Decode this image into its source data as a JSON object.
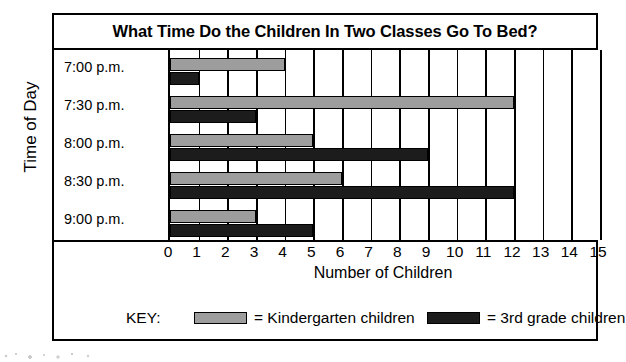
{
  "chart_data": {
    "type": "bar",
    "orientation": "horizontal",
    "title": "What Time Do the Children In Two Classes Go To Bed?",
    "xlabel": "Number of Children",
    "ylabel": "Time of Day",
    "categories": [
      "7:00 p.m.",
      "7:30 p.m.",
      "8:00 p.m.",
      "8:30 p.m.",
      "9:00 p.m."
    ],
    "series": [
      {
        "name": "= Kindergarten children",
        "short_name": "Kindergarten children",
        "color": "#9d9d9d",
        "values": [
          4,
          12,
          5,
          6,
          3
        ]
      },
      {
        "name": "= 3rd grade children",
        "short_name": "3rd grade children",
        "color": "#1c1c1c",
        "values": [
          1,
          3,
          9,
          12,
          5
        ]
      }
    ],
    "xlim": [
      0,
      15
    ],
    "xticks": [
      "0",
      "1",
      "2",
      "3",
      "4",
      "5",
      "6",
      "7",
      "8",
      "9",
      "10",
      "11",
      "12",
      "13",
      "14",
      "15"
    ],
    "grid": true,
    "grid_axis": "x",
    "legend_position": "bottom",
    "legend_key_label": "KEY:"
  },
  "colors": {
    "kindergarten": "#9d9d9d",
    "grade3": "#1c1c1c",
    "frame": "#000000",
    "background": "#ffffff"
  }
}
